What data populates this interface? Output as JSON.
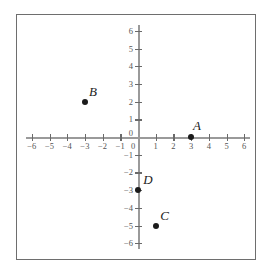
{
  "chart_data": {
    "type": "scatter",
    "title": "",
    "xlabel": "",
    "ylabel": "",
    "xlim": [
      -6,
      6
    ],
    "ylim": [
      -6,
      6
    ],
    "grid": false,
    "legend": false,
    "x_ticks": [
      -6,
      -5,
      -4,
      -3,
      -2,
      -1,
      0,
      1,
      2,
      3,
      4,
      5,
      6
    ],
    "y_ticks": [
      -6,
      -5,
      -4,
      -3,
      -2,
      -1,
      0,
      1,
      2,
      3,
      4,
      5,
      6
    ],
    "x_tick_labels": [
      "−6",
      "−5",
      "−4",
      "−3",
      "−2",
      "−1",
      "0",
      "1",
      "2",
      "3",
      "4",
      "5",
      "6"
    ],
    "y_tick_labels": [
      "−6",
      "−5",
      "−4",
      "−3",
      "−2",
      "−1",
      "0",
      "1",
      "2",
      "3",
      "4",
      "5",
      "6"
    ],
    "points": [
      {
        "label": "A",
        "x": 3,
        "y": 0,
        "label_dx": 6,
        "label_dy": -12
      },
      {
        "label": "B",
        "x": -3,
        "y": 2,
        "label_dx": 8,
        "label_dy": -11
      },
      {
        "label": "C",
        "x": 1,
        "y": -5,
        "label_dx": 9,
        "label_dy": -11
      },
      {
        "label": "D",
        "x": 0,
        "y": -3,
        "label_dx": 10,
        "label_dy": -11
      }
    ],
    "colors": {
      "point": "#1b1b1b",
      "axis": "#9a9a9a",
      "tick": "#6a6a6a",
      "tick_label": "#555555",
      "frame": "#6e6e6e",
      "background": "#ffffff"
    }
  },
  "geometry": {
    "origin_x": 137,
    "origin_y": 136,
    "unit_px": 17.7,
    "axis_half_span": 6.35
  }
}
